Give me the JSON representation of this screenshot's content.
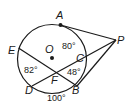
{
  "diagram": {
    "type": "circle-geometry",
    "points": {
      "A": "A",
      "B": "B",
      "C": "C",
      "D": "D",
      "E": "E",
      "F": "F",
      "O": "O",
      "P": "P"
    },
    "arcs": {
      "AC": "80°",
      "ED": "82°",
      "DB": "100°"
    },
    "angles": {
      "CFB": "48°"
    },
    "colors": {
      "stroke": "#1a1a1a",
      "background": "#ffffff"
    }
  }
}
